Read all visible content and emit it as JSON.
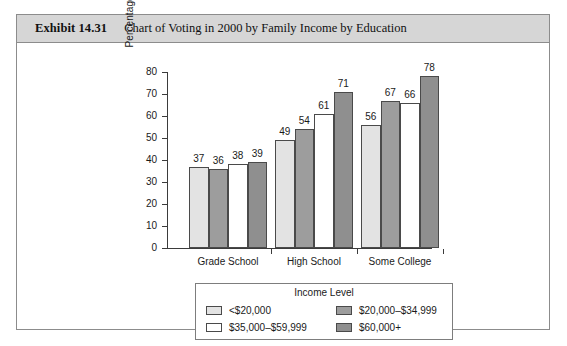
{
  "exhibit": {
    "number": "Exhibit 14.31",
    "title": "Chart of Voting in 2000 by Family Income by Education"
  },
  "chart_data": {
    "type": "bar",
    "title": "Chart of Voting in 2000 by Family Income by Education",
    "xlabel": "",
    "ylabel": "Percentage Who Voted",
    "ylim": [
      0,
      80
    ],
    "ytick_step": 10,
    "yticks": [
      "80",
      "70",
      "60",
      "50",
      "40",
      "30",
      "20",
      "10",
      "0"
    ],
    "grid": false,
    "legend_position": "bottom",
    "legend_title": "Income Level",
    "categories": [
      "Grade School",
      "High School",
      "Some College"
    ],
    "series": [
      {
        "name": "<$20,000",
        "color": "#e3e3e3",
        "values": [
          37,
          49,
          56
        ]
      },
      {
        "name": "$20,000–$34,999",
        "color": "#9d9d9d",
        "values": [
          36,
          54,
          67
        ]
      },
      {
        "name": "$35,000–$59,999",
        "color": "#ffffff",
        "values": [
          38,
          61,
          66
        ]
      },
      {
        "name": "$60,000+",
        "color": "#8f8f8f",
        "values": [
          39,
          71,
          78
        ]
      }
    ]
  },
  "colors": {
    "header_band": "#d6d6d6",
    "frame": "#8c8c8c",
    "axis": "#3b3b3b",
    "text": "#1a1a1a"
  }
}
